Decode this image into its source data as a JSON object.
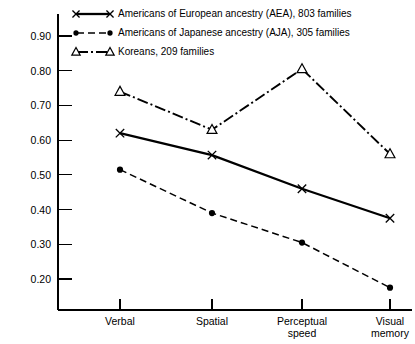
{
  "chart_data": {
    "type": "line",
    "title": "",
    "subtitle": "",
    "xlabel": "",
    "ylabel": "",
    "categories": [
      "Verbal",
      "Spatial",
      "Perceptual speed",
      "Visual memory"
    ],
    "category_lines": [
      [
        "Verbal"
      ],
      [
        "Spatial"
      ],
      [
        "Perceptual",
        "speed"
      ],
      [
        "Visual",
        "memory"
      ]
    ],
    "ylim": [
      0.15,
      0.95
    ],
    "yticks": [
      0.2,
      0.3,
      0.4,
      0.5,
      0.6,
      0.7,
      0.8,
      0.9
    ],
    "ytick_labels": [
      "0.20",
      "0.30",
      "0.40",
      "0.50",
      "0.60",
      "0.70",
      "0.80",
      "0.90"
    ],
    "grid": false,
    "legend_position": "top-center",
    "series": [
      {
        "name": "Americans of European ancestry (AEA), 803 families",
        "marker": "x",
        "linestyle": "solid",
        "color": "#000000",
        "values": [
          0.62,
          0.557,
          0.46,
          0.375
        ]
      },
      {
        "name": "Americans of Japanese ancestry (AJA), 305 families",
        "marker": "filled-circle",
        "linestyle": "dashed",
        "color": "#000000",
        "values": [
          0.515,
          0.39,
          0.305,
          0.175
        ]
      },
      {
        "name": "Koreans, 209 families",
        "marker": "open-triangle",
        "linestyle": "dash-dot",
        "color": "#000000",
        "values": [
          0.74,
          0.63,
          0.805,
          0.56
        ]
      }
    ]
  },
  "legend": {
    "items": [
      {
        "label": "Americans of European ancestry (AEA), 803 families",
        "marker": "x",
        "style": "solid"
      },
      {
        "label": "Americans of Japanese ancestry (AJA), 305 families",
        "marker": "filled-circle",
        "style": "dashed"
      },
      {
        "label": "Koreans, 209 families",
        "marker": "open-triangle",
        "style": "dash-dot"
      }
    ]
  }
}
